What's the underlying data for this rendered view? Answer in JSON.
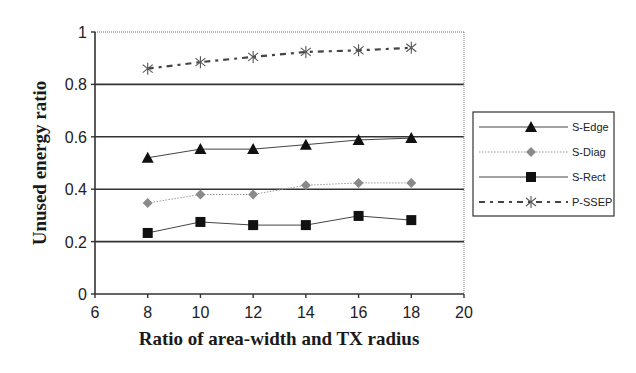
{
  "chart_data": {
    "type": "line",
    "title": "",
    "xlabel": "Ratio of area-width and TX radius",
    "ylabel": "Unused energy ratio",
    "xlim": [
      6,
      20
    ],
    "ylim": [
      0,
      1
    ],
    "xticks": [
      6,
      8,
      10,
      12,
      14,
      16,
      18,
      20
    ],
    "yticks": [
      0,
      0.2,
      0.4,
      0.6,
      0.8,
      1
    ],
    "ytick_labels": [
      "0",
      "0.2",
      "0.4",
      "0.6",
      "0.8",
      "1"
    ],
    "grid": "horizontal major gridlines",
    "legend_position": "right, outside plot",
    "x": [
      8,
      10,
      12,
      14,
      16,
      18
    ],
    "series": [
      {
        "name": "S-Edge",
        "marker": "triangle",
        "line": "solid",
        "color": "#111111",
        "values": [
          0.52,
          0.553,
          0.553,
          0.57,
          0.588,
          0.595
        ]
      },
      {
        "name": "S-Diag",
        "marker": "diamond",
        "line": "dotted",
        "color": "#888888",
        "values": [
          0.347,
          0.38,
          0.38,
          0.415,
          0.424,
          0.424
        ]
      },
      {
        "name": "S-Rect",
        "marker": "square",
        "line": "solid",
        "color": "#111111",
        "values": [
          0.233,
          0.275,
          0.263,
          0.263,
          0.298,
          0.282
        ]
      },
      {
        "name": "P-SSEP",
        "marker": "asterisk",
        "line": "dash-dot",
        "color": "#444444",
        "values": [
          0.86,
          0.885,
          0.905,
          0.924,
          0.93,
          0.94
        ]
      }
    ]
  }
}
